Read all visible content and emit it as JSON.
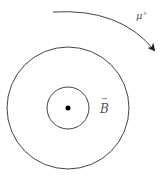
{
  "diagram": {
    "particle_label": "μ",
    "particle_charge": "+",
    "field_label": "B",
    "field_vector_arrow": "→",
    "elements": {
      "outer_circle": {
        "cx": 68,
        "cy": 108,
        "r": 61
      },
      "inner_circle": {
        "cx": 68,
        "cy": 108,
        "r": 21
      },
      "center_dot": {
        "cx": 68,
        "cy": 108,
        "r": 2.5
      },
      "trajectory_arc": "clockwise arc with arrowhead"
    },
    "colors": {
      "stroke": "#333333",
      "label": "#555555",
      "background": "#ffffff"
    }
  }
}
